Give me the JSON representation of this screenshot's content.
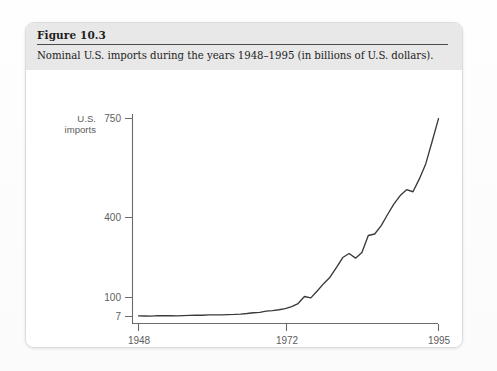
{
  "figure": {
    "number_label": "Figure 10.3",
    "caption": "Nominal U.S. imports during the years 1948–1995 (in billions of U.S. dollars)."
  },
  "chart_data": {
    "type": "line",
    "title": "Nominal U.S. imports during the years 1948–1995 (in billions of U.S. dollars).",
    "xlabel": "year",
    "ylabel": "U.S. imports",
    "ylabel_line1": "U.S.",
    "ylabel_line2": "imports",
    "xlim": [
      1948,
      1995
    ],
    "ylim": [
      7,
      750
    ],
    "grid": false,
    "legend": false,
    "y_axis_scale": "nonlinear-compressed",
    "yticks": [
      7,
      100,
      400,
      750
    ],
    "ytick_labels": [
      "7",
      "100",
      "400",
      "750"
    ],
    "xticks": [
      1948,
      1972,
      1995
    ],
    "xtick_labels": [
      "1948",
      "1972",
      "1995"
    ],
    "series": [
      {
        "name": "U.S. imports",
        "color": "#3a3a3a",
        "x": [
          1948,
          1949,
          1950,
          1951,
          1952,
          1953,
          1954,
          1955,
          1956,
          1957,
          1958,
          1959,
          1960,
          1961,
          1962,
          1963,
          1964,
          1965,
          1966,
          1967,
          1968,
          1969,
          1970,
          1971,
          1972,
          1973,
          1974,
          1975,
          1976,
          1977,
          1978,
          1979,
          1980,
          1981,
          1982,
          1983,
          1984,
          1985,
          1986,
          1987,
          1988,
          1989,
          1990,
          1991,
          1992,
          1993,
          1994,
          1995
        ],
        "values": [
          10.3,
          9.6,
          9.1,
          11.2,
          10.8,
          11.0,
          10.4,
          11.5,
          12.6,
          13.3,
          13.0,
          15.3,
          15.1,
          15.0,
          16.4,
          17.1,
          18.7,
          21.5,
          25.5,
          26.9,
          33.0,
          35.8,
          39.9,
          45.6,
          55.8,
          70.5,
          103.8,
          98.2,
          124.2,
          151.9,
          176.0,
          212.0,
          249.8,
          265.1,
          247.6,
          268.9,
          332.4,
          338.1,
          368.4,
          409.8,
          447.2,
          477.4,
          498.4,
          491.0,
          536.5,
          589.4,
          668.6,
          749.4
        ]
      }
    ]
  },
  "axis": {
    "y_label_line1": "U.S.",
    "y_label_line2": "imports",
    "x_unit_label": "year",
    "ytick_0": "7",
    "ytick_1": "100",
    "ytick_2": "400",
    "ytick_3": "750",
    "xtick_0": "1948",
    "xtick_1": "1972",
    "xtick_2": "1995"
  },
  "colors": {
    "card_background": "#ffffff",
    "header_band": "#e8e8e8",
    "page_background": "#fdfdfd",
    "axis_line": "#6b6b6b",
    "curve": "#3a3a3a",
    "text": "#232323",
    "tick_text": "#5d5d5d"
  }
}
